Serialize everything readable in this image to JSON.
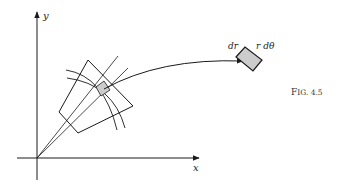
{
  "figure": {
    "caption": "Fig. 4.5",
    "caption_display": "F",
    "caption_small": "IG. 4.5",
    "axis_labels": {
      "x": "x",
      "y": "y"
    },
    "element_labels": {
      "dr": "dr",
      "rdtheta": "r dθ"
    },
    "colors": {
      "stroke": "#1a1a1a",
      "shaded_fill": "#cccccc",
      "background": "#ffffff"
    }
  }
}
